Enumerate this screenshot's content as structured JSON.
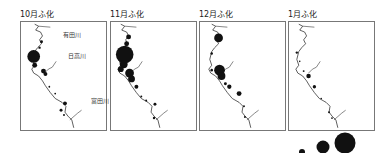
{
  "figure": {
    "type": "bubble-map-panels",
    "panels": [
      {
        "title": "10月ふ化",
        "river_labels": [
          "有田川",
          "日高川",
          "富田川"
        ]
      },
      {
        "title": "11月ふ化",
        "river_labels": []
      },
      {
        "title": "12月ふ化",
        "river_labels": []
      },
      {
        "title": "1月ふ化",
        "river_labels": []
      }
    ],
    "legend": {
      "description": "bubble size scale",
      "sizes": [
        "small",
        "medium",
        "large"
      ]
    },
    "colors": {
      "bubble": "#111111",
      "coast": "#333333",
      "frame": "#777777"
    }
  }
}
